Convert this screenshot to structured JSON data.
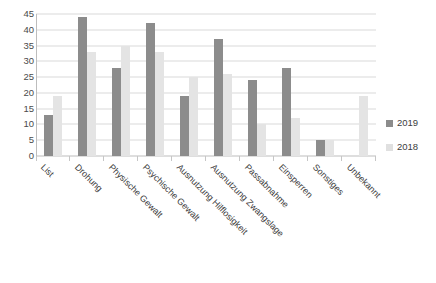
{
  "chart_data": {
    "type": "bar",
    "title": "",
    "subtitle": "",
    "xlabel": "",
    "ylabel": "",
    "ylim": [
      0,
      45
    ],
    "ytick_step": 5,
    "yticks": [
      45,
      40,
      35,
      30,
      25,
      20,
      15,
      10,
      5,
      0
    ],
    "grid": true,
    "legend_position": "right",
    "categories": [
      "List",
      "Drohung",
      "Physische Gewalt",
      "Psychische Gewalt",
      "Ausnutzung Hilflosigkeit",
      "Ausnutzung Zwangslage",
      "Passabnahme",
      "Einsperren",
      "Sonstiges",
      "Unbekannt"
    ],
    "series": [
      {
        "name": "2019",
        "color": "#8c8c8c",
        "values": [
          13,
          44,
          28,
          42,
          19,
          37,
          24,
          28,
          5,
          0
        ]
      },
      {
        "name": "2018",
        "color": "#e4e4e4",
        "values": [
          19,
          33,
          35,
          33,
          25,
          26,
          10,
          12,
          5,
          19
        ]
      }
    ]
  },
  "legend": {
    "items": [
      {
        "label": "2019",
        "series": "s2019"
      },
      {
        "label": "2018",
        "series": "s2018"
      }
    ]
  },
  "caption": ""
}
